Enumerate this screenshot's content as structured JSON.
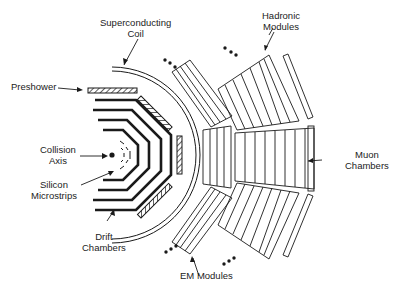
{
  "diagram": {
    "type": "detector cross-section",
    "labels": {
      "superconducting_coil": [
        "Superconducting",
        "Coil"
      ],
      "hadronic_modules": [
        "Hadronic",
        "Modules"
      ],
      "preshower": [
        "Preshower"
      ],
      "collision_axis": [
        "Collision",
        "Axis"
      ],
      "silicon_microstrips": [
        "Silicon",
        "Microstrips"
      ],
      "drift_chambers": [
        "Drift",
        "Chambers"
      ],
      "muon_chambers": [
        "Muon",
        "Chambers"
      ],
      "em_modules": [
        "EM Modules"
      ]
    },
    "colors": {
      "ink": "#1a1a1a",
      "background": "#ffffff"
    },
    "continuation_marks": "•••"
  }
}
